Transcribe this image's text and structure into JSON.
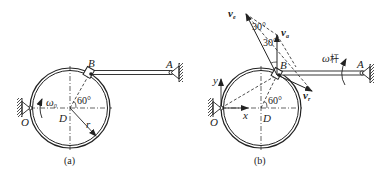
{
  "figures": [
    {
      "caption": "(a)",
      "points": {
        "O": "O",
        "D": "D",
        "B": "B",
        "A": "A"
      },
      "labels": {
        "omega0": "ω",
        "omega0_sub": "0",
        "angle": "60°",
        "radius": "r"
      }
    },
    {
      "caption": "(b)",
      "points": {
        "O": "O",
        "D": "D",
        "B": "B",
        "A": "A"
      },
      "axes": {
        "x": "x",
        "y": "y"
      },
      "labels": {
        "angle": "60°",
        "angle_top": "30°",
        "angle_mid": "30°",
        "omega_rod": "ω",
        "omega_rod_cn": "杆",
        "va": "v",
        "va_sub": "a",
        "ve": "v",
        "ve_sub": "e",
        "vr": "v",
        "vr_sub": "r"
      }
    }
  ],
  "colors": {
    "stroke": "#222222",
    "background": "#ffffff"
  }
}
